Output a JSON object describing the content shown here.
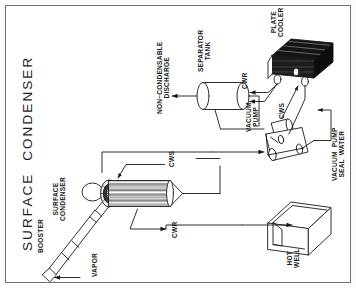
{
  "diagram": {
    "title": "SURFACE  CONDENSER",
    "orientation": "rotated-90-ccw",
    "frame_color": "#6f7072",
    "line_color": "#1a1a1a",
    "accent_dark": "#111111",
    "labels": {
      "booster": "BOOSTER",
      "vapor": "VAPOR",
      "surface_condenser": "SURFACE\nCONDENSER",
      "cws_condenser": "CWS",
      "cwr_condenser": "CWR",
      "non_condensable_discharge": "NON−CONDENSABLE\nDISCHARGE",
      "separator_tank": "SEPARATOR\nTANK",
      "cwr_cooler": "CWR",
      "cws_cooler": "CWS",
      "plate_cooler": "PLATE\nCOOLER",
      "vacuum_pump": "VACUUM\nPUMP",
      "vacuum_pump_seal_water": "VACUUM  PUMP\nSEAL  WATER",
      "hot_well": "HOT\nWELL"
    },
    "equipment": [
      {
        "name": "booster",
        "label": "BOOSTER",
        "type": "steam-jet-ejector"
      },
      {
        "name": "surface-condenser",
        "label": "SURFACE CONDENSER",
        "type": "shell-and-tube"
      },
      {
        "name": "separator-tank",
        "label": "SEPARATOR TANK",
        "type": "horizontal-vessel"
      },
      {
        "name": "plate-cooler",
        "label": "PLATE COOLER",
        "type": "plate-heat-exchanger"
      },
      {
        "name": "vacuum-pump",
        "label": "VACUUM PUMP",
        "type": "liquid-ring-pump"
      },
      {
        "name": "hot-well",
        "label": "HOT WELL",
        "type": "open-tank"
      }
    ],
    "streams": [
      {
        "name": "vapor-inlet",
        "label": "VAPOR"
      },
      {
        "name": "cooling-water-supply-condenser",
        "label": "CWS"
      },
      {
        "name": "cooling-water-return-condenser",
        "label": "CWR"
      },
      {
        "name": "non-condensable-discharge",
        "label": "NON−CONDENSABLE DISCHARGE"
      },
      {
        "name": "cooling-water-return-cooler",
        "label": "CWR"
      },
      {
        "name": "cooling-water-supply-cooler",
        "label": "CWS"
      },
      {
        "name": "vacuum-pump-seal-water",
        "label": "VACUUM PUMP SEAL WATER"
      }
    ]
  }
}
